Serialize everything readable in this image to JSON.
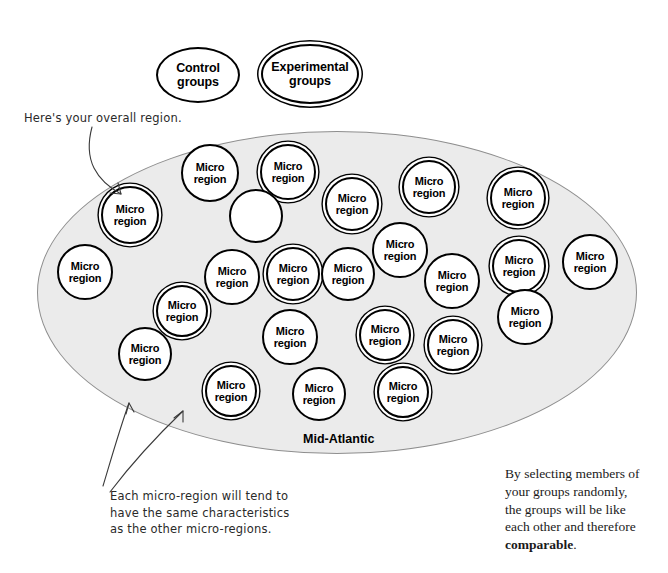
{
  "legend": {
    "control": {
      "label": "Control\ngroups",
      "style": "single-ring"
    },
    "experimental": {
      "label": "Experimental\ngroups",
      "style": "double-ring"
    }
  },
  "region": {
    "name": "Mid-Atlantic",
    "fill_color": "#ebebeb",
    "stroke_color": "#8e8e8e"
  },
  "micro_region_label": "Micro\nregion",
  "micro_regions": [
    {
      "label": "Micro\nregion",
      "ring": "double",
      "cx": 130,
      "cy": 215,
      "r": 29
    },
    {
      "label": "Micro\nregion",
      "ring": "single",
      "cx": 210,
      "cy": 173,
      "r": 29
    },
    {
      "label": "Micro\nregion",
      "ring": "double",
      "cx": 288,
      "cy": 172,
      "r": 28
    },
    {
      "label": "",
      "ring": "empty",
      "cx": 256,
      "cy": 216,
      "r": 27
    },
    {
      "label": "Micro\nregion",
      "ring": "double",
      "cx": 352,
      "cy": 204,
      "r": 27
    },
    {
      "label": "Micro\nregion",
      "ring": "double",
      "cx": 429,
      "cy": 187,
      "r": 27
    },
    {
      "label": "Micro\nregion",
      "ring": "double",
      "cx": 518,
      "cy": 198,
      "r": 28
    },
    {
      "label": "Micro\nregion",
      "ring": "single",
      "cx": 85,
      "cy": 272,
      "r": 28
    },
    {
      "label": "Micro\nregion",
      "ring": "single",
      "cx": 232,
      "cy": 277,
      "r": 28
    },
    {
      "label": "Micro\nregion",
      "ring": "double",
      "cx": 293,
      "cy": 274,
      "r": 27
    },
    {
      "label": "Micro\nregion",
      "ring": "single",
      "cx": 348,
      "cy": 274,
      "r": 27
    },
    {
      "label": "Micro\nregion",
      "ring": "single",
      "cx": 400,
      "cy": 250,
      "r": 28
    },
    {
      "label": "Micro\nregion",
      "ring": "single",
      "cx": 452,
      "cy": 281,
      "r": 28
    },
    {
      "label": "Micro\nregion",
      "ring": "double",
      "cx": 519,
      "cy": 266,
      "r": 27
    },
    {
      "label": "Micro\nregion",
      "ring": "single",
      "cx": 590,
      "cy": 262,
      "r": 28
    },
    {
      "label": "Micro\nregion",
      "ring": "double",
      "cx": 182,
      "cy": 311,
      "r": 26
    },
    {
      "label": "Micro\nregion",
      "ring": "single",
      "cx": 525,
      "cy": 317,
      "r": 28
    },
    {
      "label": "Micro\nregion",
      "ring": "single",
      "cx": 145,
      "cy": 354,
      "r": 27
    },
    {
      "label": "Micro\nregion",
      "ring": "single",
      "cx": 290,
      "cy": 337,
      "r": 28
    },
    {
      "label": "Micro\nregion",
      "ring": "double",
      "cx": 385,
      "cy": 335,
      "r": 26
    },
    {
      "label": "Micro\nregion",
      "ring": "double",
      "cx": 453,
      "cy": 345,
      "r": 26
    },
    {
      "label": "Micro\nregion",
      "ring": "double",
      "cx": 231,
      "cy": 391,
      "r": 26
    },
    {
      "label": "Micro\nregion",
      "ring": "single",
      "cx": 319,
      "cy": 394,
      "r": 27
    },
    {
      "label": "Micro\nregion",
      "ring": "double",
      "cx": 403,
      "cy": 392,
      "r": 26
    }
  ],
  "annotations": {
    "overall_region": "Here's your overall region.",
    "micro_region_note": "Each micro-region will tend to\nhave the same characteristics\nas the other micro-regions."
  },
  "body_note": {
    "line1": "By selecting members of",
    "line2": "your groups randomly,",
    "line3": "the groups will be like",
    "line4": "each other and therefore",
    "emphasis": "comparable",
    "period": "."
  }
}
